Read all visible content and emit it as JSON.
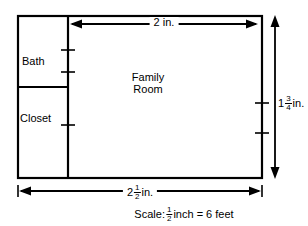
{
  "diagram": {
    "type": "floor-plan-scale-drawing",
    "rooms": [
      {
        "name": "Bath"
      },
      {
        "name": "Closet"
      },
      {
        "name": "Family\nRoom",
        "line1": "Family",
        "line2": "Room"
      }
    ],
    "dimensions": {
      "top": {
        "text": "2 in.",
        "whole": "2",
        "unit": "in.",
        "has_fraction": false,
        "orientation": "horizontal",
        "arrowheads": "both"
      },
      "right": {
        "whole": "1",
        "numerator": "3",
        "denominator": "4",
        "unit": "in.",
        "text": "1 3/4 in.",
        "orientation": "vertical",
        "arrowheads": "both"
      },
      "bottom": {
        "whole": "2",
        "numerator": "1",
        "denominator": "2",
        "unit": "in.",
        "text": "2 1/2 in.",
        "orientation": "horizontal",
        "arrowheads": "both"
      }
    },
    "scale": {
      "prefix": "Scale:",
      "numerator": "1",
      "denominator": "2",
      "suffix": "inch = 6 feet",
      "text": "Scale: 1/2 inch = 6 feet"
    },
    "colors": {
      "stroke": "#000000",
      "background": "#ffffff"
    }
  }
}
